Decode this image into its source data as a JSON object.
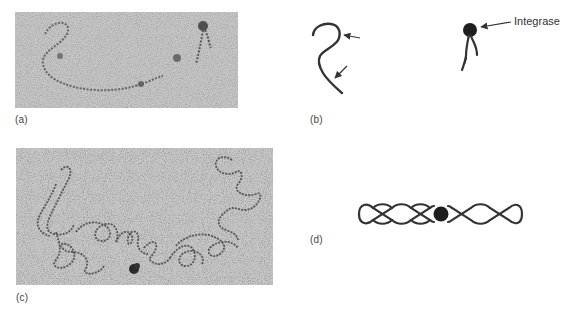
{
  "figure": {
    "panels": [
      {
        "id": "a",
        "label": "(a)",
        "kind": "electron-micrograph",
        "description": "Single DNA strand and integrase-bound DNA"
      },
      {
        "id": "b",
        "label": "(b)",
        "kind": "schematic",
        "description": "Tracing of micrograph (a) with arrows and integrase marker"
      },
      {
        "id": "c",
        "label": "(c)",
        "kind": "electron-micrograph",
        "description": "Supercoiled DNA loops with integrase at junction"
      },
      {
        "id": "d",
        "label": "(d)",
        "kind": "schematic",
        "description": "Double helix with central integrase dot"
      }
    ],
    "annotations": {
      "integrase_label": "Integrase"
    },
    "colors": {
      "micrograph_bg": "#bdbdbd",
      "strand": "#333333",
      "integrase_dot": "#1e1e1e",
      "label_text": "#444444"
    },
    "helix": {
      "left_loops": 4,
      "right_loops": 4
    }
  }
}
